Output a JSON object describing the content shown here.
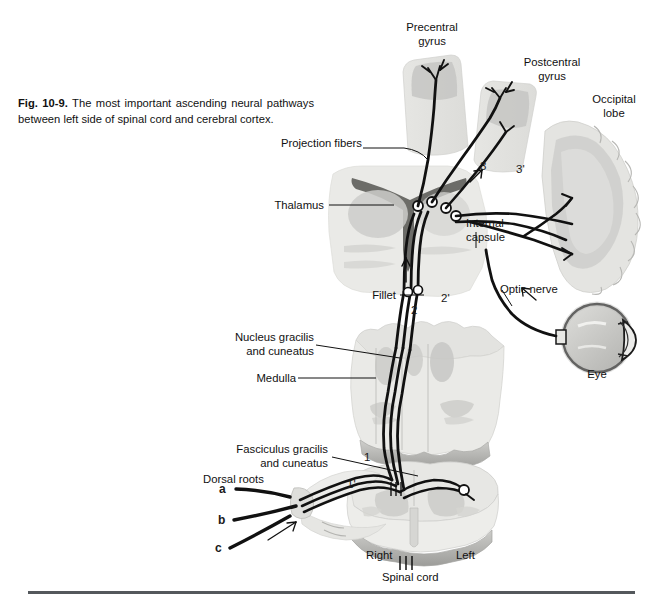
{
  "figure": {
    "number": "Fig. 10-9.",
    "caption_text": " The most important ascending neural pathways between left side of spinal cord and cerebral cortex.",
    "title_full": "Fig. 10-9. The most important ascending neural pathways between left side of spinal cord and cerebral cortex."
  },
  "labels": {
    "precentral_gyrus": "Precentral\ngyrus",
    "postcentral_gyrus": "Postcentral\ngyrus",
    "occipital_lobe": "Occipital\nlobe",
    "projection_fibers": "Projection fibers",
    "thalamus": "Thalamus",
    "internal_capsule": "Internal\ncapsule",
    "fillet": "Fillet",
    "optic_nerve": "Optic nerve",
    "eye": "Eye",
    "nucleus_gracilis": "Nucleus gracilis\nand cuneatus",
    "medulla": "Medulla",
    "fasciculus_gracilis": "Fasciculus gracilis\nand cuneatus",
    "dorsal_roots": "Dorsal roots",
    "right": "Right",
    "left": "Left",
    "spinal_cord": "Spinal cord"
  },
  "markers": {
    "root_a": "a",
    "root_b": "b",
    "root_c": "c",
    "n1": "1",
    "n1p": "1'",
    "n2": "2",
    "n2p": "2'",
    "n3": "3",
    "n3p": "3'"
  },
  "colors": {
    "ink": "#111111",
    "fiber": "#111111",
    "tissue_light": "#e9e9e7",
    "tissue_mid": "#d2d2cf",
    "tissue_dark": "#b9b9b6",
    "gray_matter": "#c9c9c6",
    "rule": "#54585c",
    "paper": "#ffffff"
  }
}
